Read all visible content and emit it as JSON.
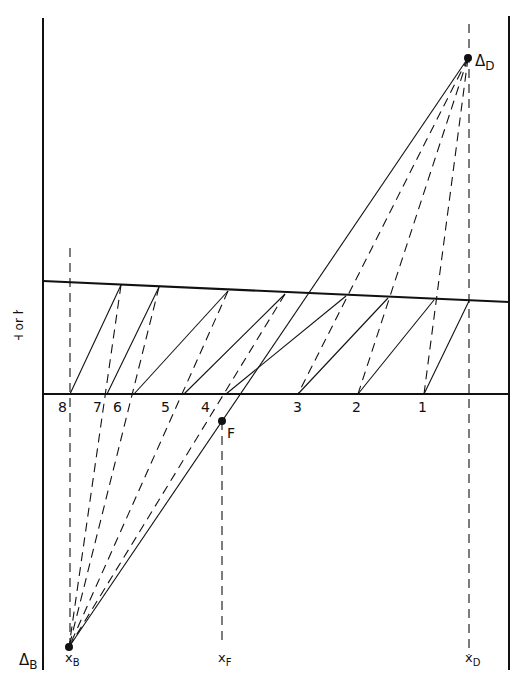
{
  "figure": {
    "type": "Ponchon-Savarit enthalpy-concentration stage construction",
    "ylabel": "H or h",
    "ink_color": "#111111",
    "background": "#ffffff"
  },
  "frame": {
    "left_axis": {
      "x": 43,
      "y1": 18,
      "y2": 670
    },
    "right_axis": {
      "x": 509,
      "y1": 16,
      "y2": 670
    }
  },
  "curves": {
    "saturated_vapor_H": {
      "x1": 43,
      "y1": 281,
      "x2": 509,
      "y2": 302
    },
    "saturated_liquid_h": {
      "x1": 43,
      "y1": 394,
      "x2": 509,
      "y2": 394
    }
  },
  "points": {
    "delta_D": {
      "x": 468,
      "y": 58,
      "label": "Δ",
      "sub": "D"
    },
    "delta_B": {
      "x": 69,
      "y": 647,
      "label": "Δ",
      "sub": "B"
    },
    "feed": {
      "x": 222,
      "y": 421,
      "label": "F"
    }
  },
  "composition_markers": [
    {
      "label": "x",
      "sub": "B",
      "x": 69
    },
    {
      "label": "x",
      "sub": "F",
      "x": 222
    },
    {
      "label": "x",
      "sub": "D",
      "x": 469
    }
  ],
  "stages": [
    {
      "n": "1",
      "liquid_x": 424,
      "vapor_x": 469,
      "vapor_y": 301
    },
    {
      "n": "2",
      "liquid_x": 358,
      "vapor_x": 434,
      "vapor_y": 300
    },
    {
      "n": "3",
      "liquid_x": 298,
      "vapor_x": 388,
      "vapor_y": 298
    },
    {
      "n": "4",
      "liquid_x": 226,
      "vapor_x": 346,
      "vapor_y": 296
    },
    {
      "n": "5",
      "liquid_x": 184,
      "vapor_x": 285,
      "vapor_y": 294
    },
    {
      "n": "6",
      "liquid_x": 134,
      "vapor_x": 228,
      "vapor_y": 291
    },
    {
      "n": "7",
      "liquid_x": 107,
      "vapor_x": 159,
      "vapor_y": 287
    },
    {
      "n": "8",
      "liquid_x": 70,
      "vapor_x": 121,
      "vapor_y": 285
    }
  ],
  "stage_labels": [
    {
      "text": "8",
      "x": 58,
      "y": 412
    },
    {
      "text": "7",
      "x": 93,
      "y": 412
    },
    {
      "text": "6",
      "x": 113,
      "y": 412
    },
    {
      "text": "5",
      "x": 161,
      "y": 412
    },
    {
      "text": "4",
      "x": 201,
      "y": 412
    },
    {
      "text": "3",
      "x": 293,
      "y": 412
    },
    {
      "text": "2",
      "x": 352,
      "y": 412
    },
    {
      "text": "1",
      "x": 418,
      "y": 412
    }
  ],
  "tie_lines_solid": [
    {
      "from": [
        70,
        394
      ],
      "to": [
        121,
        285
      ]
    },
    {
      "from": [
        107,
        394
      ],
      "to": [
        159,
        287
      ]
    },
    {
      "from": [
        134,
        394
      ],
      "to": [
        228,
        291
      ]
    },
    {
      "from": [
        184,
        394
      ],
      "to": [
        285,
        294
      ]
    },
    {
      "from": [
        226,
        394
      ],
      "to": [
        346,
        296
      ]
    },
    {
      "from": [
        298,
        394
      ],
      "to": [
        388,
        298
      ]
    },
    {
      "from": [
        358,
        394
      ],
      "to": [
        434,
        300
      ]
    },
    {
      "from": [
        424,
        394
      ],
      "to": [
        469,
        301
      ]
    }
  ],
  "operating_lines_dashed": {
    "rectifying_to_delta_D": [
      {
        "from": [
          468,
          58
        ],
        "to": [
          424,
          394
        ]
      },
      {
        "from": [
          468,
          58
        ],
        "to": [
          358,
          394
        ]
      },
      {
        "from": [
          468,
          58
        ],
        "to": [
          298,
          394
        ]
      }
    ],
    "stripping_to_delta_B": [
      {
        "from": [
          285,
          294
        ],
        "to": [
          69,
          647
        ]
      },
      {
        "from": [
          228,
          291
        ],
        "to": [
          69,
          647
        ]
      },
      {
        "from": [
          159,
          287
        ],
        "to": [
          69,
          647
        ]
      },
      {
        "from": [
          121,
          285
        ],
        "to": [
          69,
          647
        ]
      }
    ],
    "verticals": [
      {
        "x": 70,
        "y1": 248,
        "y2": 647
      },
      {
        "x": 469,
        "y1": 24,
        "y2": 655
      },
      {
        "x": 222,
        "y1": 421,
        "y2": 640
      }
    ]
  },
  "overall_balance_line": {
    "from": [
      468,
      58
    ],
    "to": [
      69,
      647
    ],
    "passes_through": "F"
  }
}
